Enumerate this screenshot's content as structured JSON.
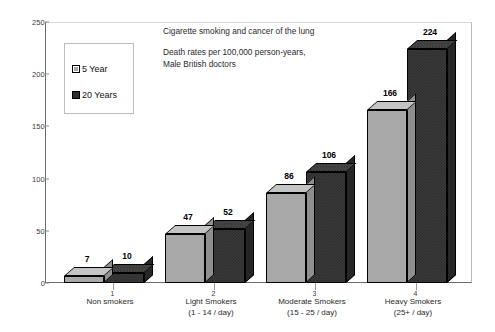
{
  "chart_data": {
    "type": "bar",
    "title": "Cigarette smoking and cancer of the lung",
    "subtitle_line1": "Death rates per 100,000 person-years,",
    "subtitle_line2": "Male British doctors",
    "xlabel": "",
    "ylabel": "",
    "ylim": [
      0,
      250
    ],
    "yticks": [
      0,
      50,
      100,
      150,
      200,
      250
    ],
    "grid": false,
    "legend_position": "top-left",
    "categories": [
      "Non smokers",
      "Light Smokers",
      "Moderate Smokers",
      "Heavy Smokers"
    ],
    "category_sublabels": [
      "",
      "(1 - 14 / day)",
      "(15 - 25 / day)",
      "(25+ / day)"
    ],
    "separator_numbers": [
      "1",
      "2",
      "3",
      "4"
    ],
    "series": [
      {
        "name": "5 Year",
        "values": [
          7,
          47,
          86,
          166
        ],
        "color": "#a8a8a8"
      },
      {
        "name": "20 Years",
        "values": [
          10,
          52,
          106,
          224
        ],
        "color": "#333333"
      }
    ]
  },
  "legend": {
    "items": [
      {
        "label": "5 Year"
      },
      {
        "label": "20 Years"
      }
    ]
  }
}
